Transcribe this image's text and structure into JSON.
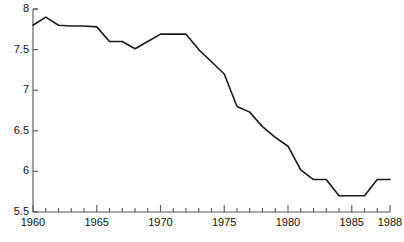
{
  "chart_data": {
    "type": "line",
    "title": "",
    "subtitle": "",
    "xlabel": "",
    "ylabel": "",
    "xlim": [
      1960,
      1988
    ],
    "ylim": [
      5.5,
      8.0
    ],
    "grid": false,
    "legend": false,
    "legend_position": "none",
    "line_color": "#1a1a1a",
    "line_width": 1.6,
    "axis_color": "#555555",
    "x_major_ticks": [
      1960,
      1965,
      1970,
      1975,
      1980,
      1985,
      1988
    ],
    "x_minor_tick_step": 1,
    "x_tick_labels": [
      "1960",
      "1965",
      "1970",
      "1975",
      "1980",
      "1985",
      "1988"
    ],
    "y_ticks": [
      5.5,
      6.0,
      6.5,
      7.0,
      7.5,
      8.0
    ],
    "y_tick_labels": [
      "5.5",
      "6",
      "6.5",
      "7",
      "7.5",
      "8"
    ],
    "series": [
      {
        "name": "series-1",
        "x": [
          1960,
          1961,
          1962,
          1963,
          1964,
          1965,
          1966,
          1967,
          1968,
          1969,
          1970,
          1971,
          1972,
          1973,
          1974,
          1975,
          1976,
          1977,
          1978,
          1979,
          1980,
          1981,
          1982,
          1983,
          1984,
          1985,
          1986,
          1987,
          1988
        ],
        "values": [
          7.8,
          7.9,
          7.8,
          7.79,
          7.79,
          7.78,
          7.6,
          7.6,
          7.51,
          7.6,
          7.69,
          7.69,
          7.69,
          7.5,
          7.35,
          7.2,
          6.8,
          6.73,
          6.55,
          6.42,
          6.31,
          6.02,
          5.9,
          5.9,
          5.7,
          5.7,
          5.7,
          5.9,
          5.9
        ]
      }
    ]
  },
  "axes": {
    "y_axis_name": "value-axis",
    "x_axis_name": "year-axis"
  }
}
